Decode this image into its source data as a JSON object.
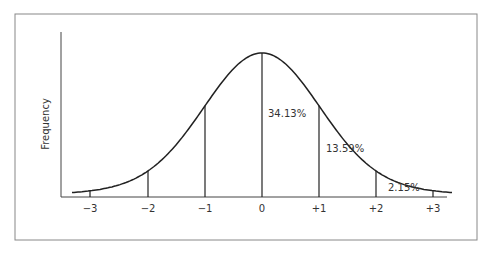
{
  "chart_data": {
    "type": "line",
    "title": "",
    "xlabel": "",
    "ylabel": "Frequency",
    "x_ticks": [
      "−3",
      "−2",
      "−1",
      "0",
      "+1",
      "+2",
      "+3"
    ],
    "x": [
      -3,
      -2,
      -1,
      0,
      1,
      2,
      3
    ],
    "annotations": [
      {
        "label": "34.13%",
        "region": "0 to +1"
      },
      {
        "label": "13.59%",
        "region": "+1 to +2"
      },
      {
        "label": "2.15%",
        "region": "+2 to +3"
      }
    ],
    "grid": false,
    "legend": null
  },
  "labels": {
    "ylabel": "Frequency",
    "ticks": [
      "−3",
      "−2",
      "−1",
      "0",
      "+1",
      "+2",
      "+3"
    ],
    "pct1": "34.13%",
    "pct2": "13.59%",
    "pct3": "2.15%"
  }
}
